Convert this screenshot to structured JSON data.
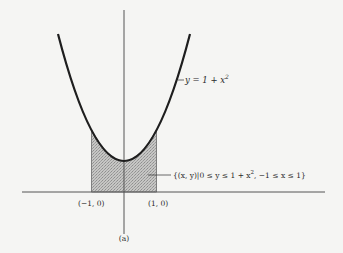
{
  "figure": {
    "caption": "(a)",
    "curve_label": "y = 1 + x",
    "curve_label_exp": "2",
    "region_label_pre": "{(x, y)|0 ≤ y ≤ 1 + x",
    "region_label_exp": "2",
    "region_label_post": ", −1 ≤ x ≤ 1}",
    "point_left": "(−1, 0)",
    "point_right": "(1, 0)"
  },
  "colors": {
    "background": "#f5f5f3",
    "curve": "#1e1e1e",
    "axis": "#555555",
    "shade": "#b5b5b5"
  }
}
